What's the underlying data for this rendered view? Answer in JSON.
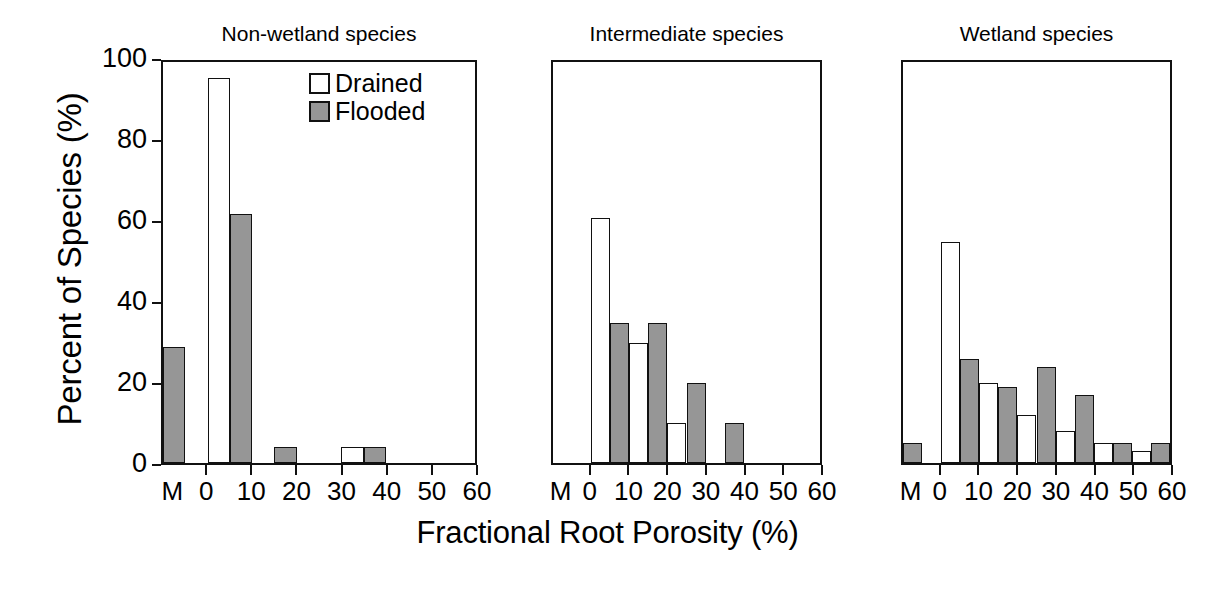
{
  "figure": {
    "ylabel": "Percent of Species (%)",
    "xlabel": "Fractional Root Porosity (%)"
  },
  "legend": {
    "position": "panel-1-top-right",
    "entries": [
      {
        "label": "Drained",
        "swatch": "white-square",
        "color": "#ffffff"
      },
      {
        "label": "Flooded",
        "swatch": "gray-square",
        "color": "#969696"
      }
    ]
  },
  "axes": {
    "y_ticks": [
      "0",
      "20",
      "40",
      "60",
      "80",
      "100"
    ],
    "y_tick_values": [
      0,
      20,
      40,
      60,
      80,
      100
    ],
    "x_ticks": [
      "0",
      "10",
      "20",
      "30",
      "40",
      "50",
      "60"
    ],
    "x_tick_values": [
      0,
      10,
      20,
      30,
      40,
      50,
      60
    ],
    "x_special_tick": "M"
  },
  "chart_data": {
    "type": "bar",
    "title": "",
    "xlabel": "Fractional Root Porosity (%)",
    "ylabel": "Percent of Species (%)",
    "ylim": [
      0,
      100
    ],
    "xlim": [
      -10,
      60
    ],
    "grid": false,
    "legend_position": "upper right of first panel",
    "categories": [
      "M",
      "0-5",
      "5-10",
      "10-15",
      "15-20",
      "20-25",
      "25-30",
      "30-35",
      "35-40",
      "40-45",
      "45-50",
      "50-55",
      "55-60"
    ],
    "bin_starts": [
      -10,
      0,
      5,
      10,
      15,
      20,
      25,
      30,
      35,
      40,
      45,
      50,
      55
    ],
    "panels": [
      {
        "title": "Non-wetland species",
        "series": [
          {
            "name": "Drained",
            "color": "#ffffff",
            "values": [
              0,
              96,
              0,
              0,
              0,
              0,
              0,
              4,
              0,
              0,
              0,
              0,
              0
            ]
          },
          {
            "name": "Flooded",
            "color": "#969696",
            "values": [
              29,
              0,
              62,
              0,
              4,
              0,
              0,
              0,
              4,
              0,
              0,
              0,
              0
            ]
          }
        ]
      },
      {
        "title": "Intermediate species",
        "series": [
          {
            "name": "Drained",
            "color": "#ffffff",
            "values": [
              0,
              61,
              0,
              30,
              0,
              10,
              0,
              0,
              0,
              0,
              0,
              0,
              0
            ]
          },
          {
            "name": "Flooded",
            "color": "#969696",
            "values": [
              0,
              0,
              35,
              0,
              35,
              0,
              20,
              0,
              10,
              0,
              0,
              0,
              0
            ]
          }
        ]
      },
      {
        "title": "Wetland species",
        "series": [
          {
            "name": "Drained",
            "color": "#ffffff",
            "values": [
              0,
              55,
              0,
              20,
              0,
              12,
              0,
              8,
              0,
              5,
              0,
              3,
              0
            ]
          },
          {
            "name": "Flooded",
            "color": "#969696",
            "values": [
              5,
              0,
              26,
              0,
              19,
              0,
              24,
              0,
              17,
              0,
              5,
              0,
              5
            ]
          }
        ]
      }
    ]
  }
}
